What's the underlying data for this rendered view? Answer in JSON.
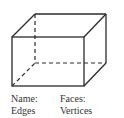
{
  "diagram": {
    "shape": "rectangular-prism",
    "line_color": "#2b2b2b",
    "hidden_edge_style": "dashed"
  },
  "labels": {
    "name": "Name:",
    "faces": "Faces:",
    "edges": "Edges",
    "vertices": "Vertices"
  }
}
